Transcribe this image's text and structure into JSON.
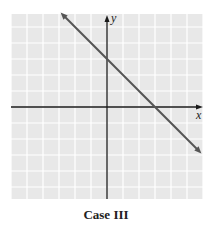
{
  "caption": "Case III",
  "colors": {
    "grid_bg": "#e8e8e8",
    "grid_line": "#ffffff",
    "axis": "#1a1a1a",
    "line": "#555555"
  },
  "chart_data": {
    "type": "line",
    "title": "Case III",
    "xlabel": "x",
    "ylabel": "y",
    "xlim": [
      -6,
      6
    ],
    "ylim": [
      -5.8,
      5.8
    ],
    "grid": true,
    "tick_labels": false,
    "series": [
      {
        "name": "line",
        "equation": "y = -x + 3",
        "slope": -1,
        "y_intercept": 3,
        "x_intercept": 3,
        "x": [
          -2.9,
          5.9
        ],
        "y": [
          5.9,
          -2.9
        ],
        "arrows_both_ends": true
      }
    ]
  }
}
